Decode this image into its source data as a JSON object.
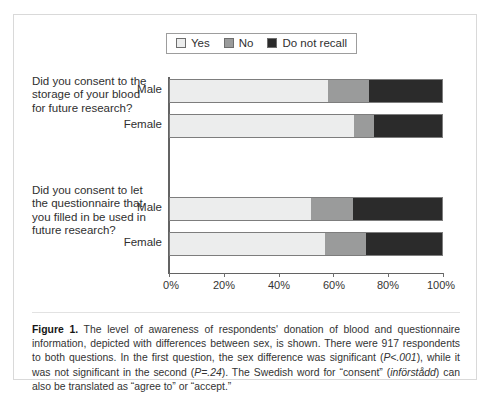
{
  "figure": {
    "caption_label": "Figure 1.",
    "caption_text_1": " The level of awareness of respondents' donation of blood and questionnaire information, depicted with differences between sex, is shown. There were 917 respondents to both questions. In the first question, the sex difference was significant (",
    "caption_stat_1": "P<.001",
    "caption_text_2": "), while it was not significant in the second (",
    "caption_stat_2": "P=.24",
    "caption_text_3": "). The Swedish word for “consent” (",
    "caption_swedish": "införstådd",
    "caption_text_4": ") can also be translated as “agree to” or “accept.”"
  },
  "colors": {
    "yes": "#eceded",
    "no": "#9a9b9b",
    "do_not_recall": "#2b2b2b",
    "axis": "#636363",
    "panel_border": "#d9d9d9",
    "text": "#2f2f2f"
  },
  "chart_data": {
    "type": "bar",
    "title": "",
    "xlabel": "",
    "ylabel": "",
    "orientation": "horizontal",
    "stacked": true,
    "grid": false,
    "legend_position": "top",
    "xlim": [
      0,
      100
    ],
    "xticks": [
      0,
      20,
      40,
      60,
      80,
      100
    ],
    "xtick_labels": [
      "0%",
      "20%",
      "40%",
      "60%",
      "80%",
      "100%"
    ],
    "legend": [
      {
        "label": "Yes",
        "color": "#eceded"
      },
      {
        "label": "No",
        "color": "#9a9b9b"
      },
      {
        "label": "Do not recall",
        "color": "#2b2b2b"
      }
    ],
    "series": [
      {
        "name": "Yes",
        "values": [
          58,
          67.5,
          52,
          57
        ]
      },
      {
        "name": "No",
        "values": [
          15,
          7.5,
          15,
          15
        ]
      },
      {
        "name": "Do not recall",
        "values": [
          27,
          25,
          33,
          28
        ]
      }
    ],
    "groups": [
      {
        "question": "Did you consent to the storage of your blood for future research?",
        "categories": [
          "Male",
          "Female"
        ],
        "bars": [
          {
            "category": "Male",
            "segments": [
              {
                "label": "Yes",
                "value": 58
              },
              {
                "label": "No",
                "value": 15
              },
              {
                "label": "Do not recall",
                "value": 27
              }
            ]
          },
          {
            "category": "Female",
            "segments": [
              {
                "label": "Yes",
                "value": 67.5
              },
              {
                "label": "No",
                "value": 7.5
              },
              {
                "label": "Do not recall",
                "value": 25
              }
            ]
          }
        ]
      },
      {
        "question": "Did you consent to let the questionnaire that you filled in be used in future research?",
        "categories": [
          "Male",
          "Female"
        ],
        "bars": [
          {
            "category": "Male",
            "segments": [
              {
                "label": "Yes",
                "value": 52
              },
              {
                "label": "No",
                "value": 15
              },
              {
                "label": "Do not recall",
                "value": 33
              }
            ]
          },
          {
            "category": "Female",
            "segments": [
              {
                "label": "Yes",
                "value": 57
              },
              {
                "label": "No",
                "value": 15
              },
              {
                "label": "Do not recall",
                "value": 28
              }
            ]
          }
        ]
      }
    ]
  },
  "q1": {
    "text": "Did you consent to the storage of your blood for future research?",
    "male_label": "Male",
    "female_label": "Female"
  },
  "q2": {
    "text": "Did you consent to let the questionnaire that you filled in be used in future research?",
    "male_label": "Male",
    "female_label": "Female"
  },
  "xticks": {
    "t0": "0%",
    "t1": "20%",
    "t2": "40%",
    "t3": "60%",
    "t4": "80%",
    "t5": "100%"
  }
}
